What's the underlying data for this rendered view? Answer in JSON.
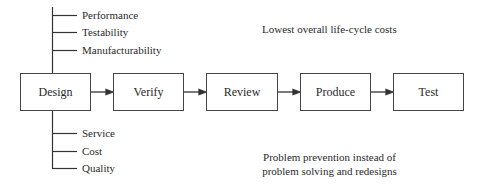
{
  "diagram": {
    "process_steps": [
      "Design",
      "Verify",
      "Review",
      "Produce",
      "Test"
    ],
    "design_attributes_top": [
      "Performance",
      "Testability",
      "Manufacturability"
    ],
    "design_attributes_bottom": [
      "Service",
      "Cost",
      "Quality"
    ],
    "notes": {
      "top": "Lowest overall life-cycle costs",
      "bottom_line1": "Problem prevention instead of",
      "bottom_line2": "problem solving and redesigns"
    },
    "line_color": "#333333"
  }
}
